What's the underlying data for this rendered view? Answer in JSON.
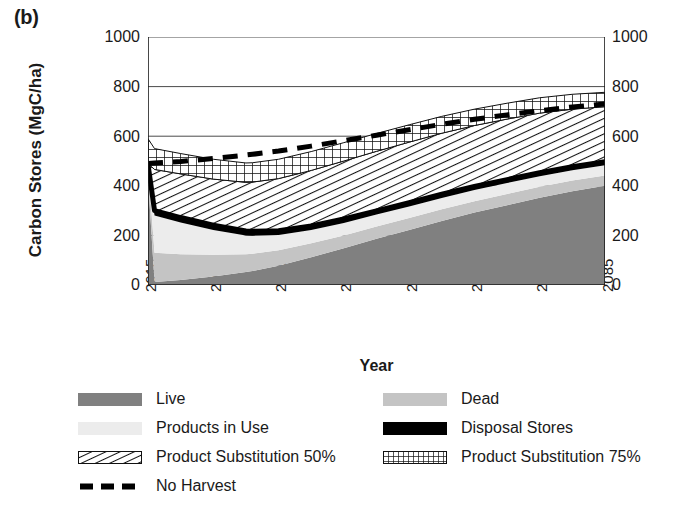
{
  "panel": {
    "label": "(b)"
  },
  "axes": {
    "ytitle": "Carbon Stores (MgC/ha)",
    "xtitle": "Year",
    "yticks": [
      "0",
      "200",
      "400",
      "600",
      "800",
      "1000"
    ],
    "xticks": [
      "2015",
      "2025",
      "2035",
      "2045",
      "2055",
      "2065",
      "2075",
      "2085"
    ]
  },
  "legend": {
    "items": [
      {
        "label": "Live",
        "pattern": "solid-dark-gray",
        "color": "#808080"
      },
      {
        "label": "Dead",
        "pattern": "solid-mid-gray",
        "color": "#c4c4c4"
      },
      {
        "label": "Products in Use",
        "pattern": "solid-light-gray",
        "color": "#ececec"
      },
      {
        "label": "Disposal Stores",
        "pattern": "solid-black",
        "color": "#000000"
      },
      {
        "label": "Product Substitution 50%",
        "pattern": "diagonal-hatch",
        "color": "#ffffff"
      },
      {
        "label": "Product Substitution 75%",
        "pattern": "crosshatch-grid",
        "color": "#ffffff"
      },
      {
        "label": "No Harvest",
        "pattern": "dashed-line",
        "color": "#000000"
      }
    ]
  },
  "chart_data": {
    "type": "area",
    "title": "",
    "xlabel": "Year",
    "ylabel": "Carbon Stores (MgC/ha)",
    "xlim": [
      2015,
      2085
    ],
    "ylim": [
      0,
      1000
    ],
    "grid": true,
    "legend_position": "below",
    "stacked": true,
    "x": [
      2015,
      2016,
      2020,
      2025,
      2030,
      2031,
      2035,
      2040,
      2045,
      2050,
      2055,
      2060,
      2065,
      2070,
      2075,
      2080,
      2085
    ],
    "series": [
      {
        "name": "Live",
        "stack_order": 1,
        "fill": "#808080",
        "values": [
          430,
          12,
          20,
          34,
          52,
          56,
          78,
          112,
          148,
          186,
          222,
          258,
          292,
          322,
          352,
          378,
          400
        ]
      },
      {
        "name": "Dead",
        "stack_order": 2,
        "fill": "#c4c4c4",
        "values": [
          50,
          118,
          104,
          88,
          72,
          70,
          62,
          56,
          52,
          50,
          48,
          47,
          46,
          45,
          44,
          43,
          42
        ]
      },
      {
        "name": "Products in Use",
        "stack_order": 3,
        "fill": "#ececec",
        "values": [
          0,
          150,
          128,
          100,
          76,
          73,
          62,
          54,
          50,
          48,
          47,
          46,
          45,
          44,
          43,
          42,
          41
        ]
      },
      {
        "name": "Disposal Stores",
        "stack_order": 4,
        "fill": "#000000",
        "values": [
          6,
          20,
          20,
          19,
          18,
          18,
          17,
          16,
          16,
          15,
          15,
          15,
          14,
          14,
          14,
          14,
          14
        ]
      },
      {
        "name": "Product Substitution 50%",
        "stack_order": 5,
        "fill": "diagonal-hatch",
        "values": [
          4,
          166,
          176,
          186,
          196,
          198,
          210,
          224,
          234,
          240,
          244,
          246,
          246,
          244,
          240,
          232,
          222
        ]
      },
      {
        "name": "Product Substitution 75%",
        "stack_order": 6,
        "fill": "crosshatch-grid",
        "values": [
          100,
          84,
          82,
          80,
          78,
          78,
          78,
          76,
          74,
          72,
          70,
          68,
          66,
          64,
          62,
          60,
          58
        ]
      }
    ],
    "cumulative_totals": {
      "Live": [
        430,
        12,
        20,
        34,
        52,
        56,
        78,
        112,
        148,
        186,
        222,
        258,
        292,
        322,
        352,
        378,
        400
      ],
      "Dead": [
        480,
        130,
        124,
        122,
        124,
        126,
        140,
        168,
        200,
        236,
        270,
        305,
        338,
        367,
        396,
        421,
        442
      ],
      "Products in Use": [
        480,
        280,
        252,
        222,
        200,
        199,
        202,
        222,
        250,
        284,
        317,
        351,
        383,
        411,
        439,
        463,
        483
      ],
      "Disposal Stores": [
        486,
        300,
        272,
        241,
        218,
        217,
        219,
        238,
        266,
        299,
        332,
        366,
        397,
        425,
        453,
        477,
        497
      ],
      "Product Substitution 50%": [
        490,
        466,
        448,
        427,
        414,
        415,
        429,
        462,
        500,
        539,
        576,
        612,
        643,
        669,
        693,
        709,
        719
      ],
      "Product Substitution 75%": [
        590,
        550,
        530,
        507,
        492,
        493,
        507,
        538,
        574,
        611,
        646,
        680,
        709,
        733,
        755,
        769,
        777
      ]
    },
    "lines": [
      {
        "name": "No Harvest",
        "style": "dashed",
        "color": "#000000",
        "width": 5,
        "values": [
          490,
          492,
          498,
          510,
          524,
          527,
          540,
          560,
          582,
          604,
          626,
          648,
          668,
          686,
          703,
          718,
          730
        ]
      }
    ]
  }
}
